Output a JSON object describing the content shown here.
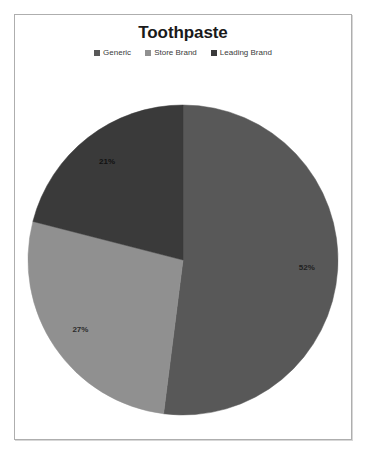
{
  "chart": {
    "title": "Toothpaste",
    "frame_border_color": "#aeaeae",
    "background": "#ffffff"
  },
  "legend": {
    "position": "top",
    "items": [
      {
        "label": "Generic",
        "color": "#585858",
        "marker": "square-marker"
      },
      {
        "label": "Store Brand",
        "color": "#909090",
        "marker": "square-marker"
      },
      {
        "label": "Leading Brand",
        "color": "#3a3a3a",
        "marker": "square-marker"
      }
    ]
  },
  "chart_data": {
    "type": "pie",
    "title": "Toothpaste",
    "xlabel": "",
    "ylabel": "",
    "legend_position": "top",
    "grid": false,
    "categories": [
      "Generic",
      "Store Brand",
      "Leading Brand"
    ],
    "values": [
      52,
      27,
      21
    ],
    "value_unit": "%",
    "data_labels": [
      "52%",
      "27%",
      "21%"
    ],
    "colors": [
      "#585858",
      "#909090",
      "#3a3a3a"
    ],
    "start_angle_deg": 0,
    "direction": "clockwise",
    "slices": [
      {
        "name": "Generic",
        "value": 52,
        "label": "52%",
        "color": "#585858",
        "label_color": "#1f1f1f"
      },
      {
        "name": "Store Brand",
        "value": 27,
        "label": "27%",
        "color": "#909090",
        "label_color": "#2b2b2b"
      },
      {
        "name": "Leading Brand",
        "value": 21,
        "label": "21%",
        "color": "#3a3a3a",
        "label_color": "#111111"
      }
    ]
  },
  "labels": {
    "generic_pct": "52%",
    "store_brand_pct": "27%",
    "leading_brand_pct": "21%"
  }
}
